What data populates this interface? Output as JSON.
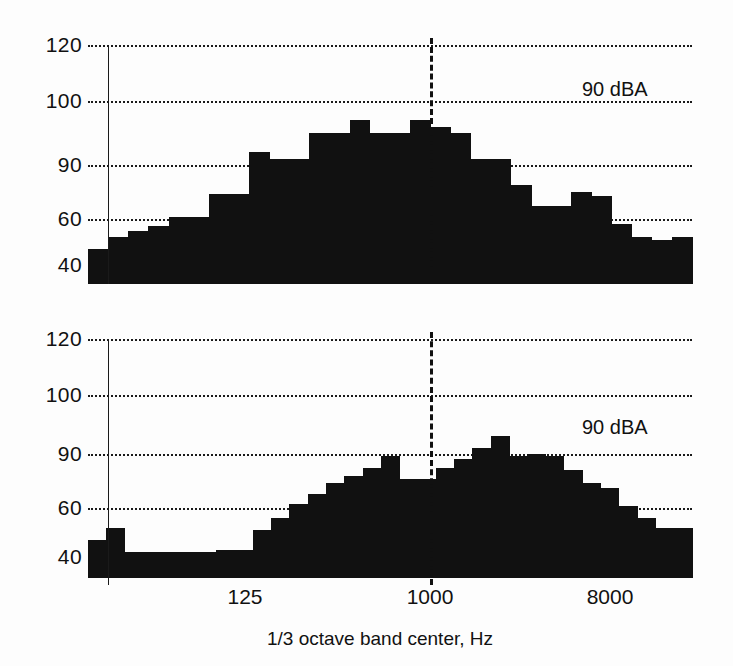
{
  "figure": {
    "background": "#fdfdfd",
    "ink_color": "#111111"
  },
  "chart_data": [
    {
      "type": "bar",
      "panel": "top",
      "title": "",
      "xlabel": "",
      "ylabel": "",
      "annotation": "90 dBA",
      "grid": true,
      "legend": "none",
      "ylim": [
        33,
        120
      ],
      "ytick_labels": [
        "40",
        "60",
        "90",
        "100",
        "120"
      ],
      "ytick_values": [
        40,
        60,
        90,
        100,
        120
      ],
      "xtick_labels": [
        "125",
        "1000",
        "8000"
      ],
      "xtick_values": [
        125,
        1000,
        8000
      ],
      "vertical_reference_lines": [
        {
          "label": "",
          "style": "solid",
          "x_band_index": 2
        },
        {
          "label": "1000",
          "style": "dashed",
          "x_band_index": 21
        }
      ],
      "categories": [
        25,
        31.5,
        40,
        50,
        63,
        80,
        100,
        125,
        160,
        200,
        250,
        315,
        400,
        500,
        630,
        800,
        1000,
        1250,
        1600,
        2000,
        2500,
        3150,
        4000,
        5000,
        6300,
        8000,
        10000,
        12500,
        16000,
        20000
      ],
      "values": [
        47,
        52,
        55,
        57,
        61,
        61,
        74,
        74,
        92,
        91,
        91,
        95,
        95,
        97,
        95,
        95,
        97,
        96,
        95,
        91,
        91,
        79,
        67,
        67,
        75,
        73,
        58,
        52,
        51,
        52
      ]
    },
    {
      "type": "bar",
      "panel": "bottom",
      "title": "",
      "xlabel": "1/3 octave band center, Hz",
      "ylabel": "",
      "annotation": "90 dBA",
      "grid": true,
      "legend": "none",
      "ylim": [
        33,
        120
      ],
      "ytick_labels": [
        "40",
        "60",
        "90",
        "100",
        "120"
      ],
      "ytick_values": [
        40,
        60,
        90,
        100,
        120
      ],
      "xtick_labels": [
        "125",
        "1000",
        "8000"
      ],
      "xtick_values": [
        125,
        1000,
        8000
      ],
      "vertical_reference_lines": [
        {
          "label": "",
          "style": "solid",
          "x_band_index": 2
        },
        {
          "label": "1000",
          "style": "dashed",
          "x_band_index": 21
        }
      ],
      "categories": [
        25,
        31.5,
        40,
        50,
        63,
        80,
        100,
        125,
        160,
        200,
        250,
        315,
        400,
        500,
        630,
        800,
        1000,
        1250,
        1600,
        2000,
        2500,
        3150,
        4000,
        5000,
        6300,
        8000,
        10000,
        12500,
        16000,
        20000
      ],
      "values": [
        47,
        52,
        42,
        42,
        42,
        42,
        42,
        43,
        43,
        51,
        56,
        62,
        68,
        74,
        78,
        82,
        89,
        76,
        76,
        82,
        87,
        91,
        93,
        89,
        90,
        89,
        81,
        74,
        71,
        61,
        56,
        52,
        52
      ]
    }
  ],
  "panels": {
    "top": {
      "name": "top-panel",
      "annotation": "90 dBA",
      "yticks": [
        "120",
        "100",
        "90",
        "60",
        "40"
      ]
    },
    "bottom": {
      "name": "bottom-panel",
      "annotation": "90 dBA",
      "yticks": [
        "120",
        "100",
        "90",
        "60",
        "40"
      ],
      "xticks": [
        "125",
        "1000",
        "8000"
      ],
      "xaxis_title": "1/3 octave band center, Hz"
    }
  }
}
